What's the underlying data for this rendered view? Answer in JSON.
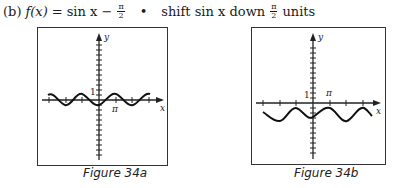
{
  "heading": {
    "part_label": "(b)",
    "function_lhs": "f(x)",
    "equals": "=",
    "expression": "sin x −",
    "frac_num": "π",
    "frac_den": "2",
    "bullet": "•",
    "description_pre": "shift sin x down",
    "description_frac_num": "π",
    "description_frac_den": "2",
    "description_post": "units"
  },
  "figures": [
    {
      "caption": "Figure 34a",
      "x_axis_label": "x",
      "y_axis_label": "y",
      "tick_label_y": "1",
      "tick_label_x": "π",
      "curve": "sin x"
    },
    {
      "caption": "Figure 34b",
      "x_axis_label": "x",
      "y_axis_label": "y",
      "tick_label_y": "1",
      "tick_label_x": "π",
      "curve": "sin x − π/2"
    }
  ]
}
